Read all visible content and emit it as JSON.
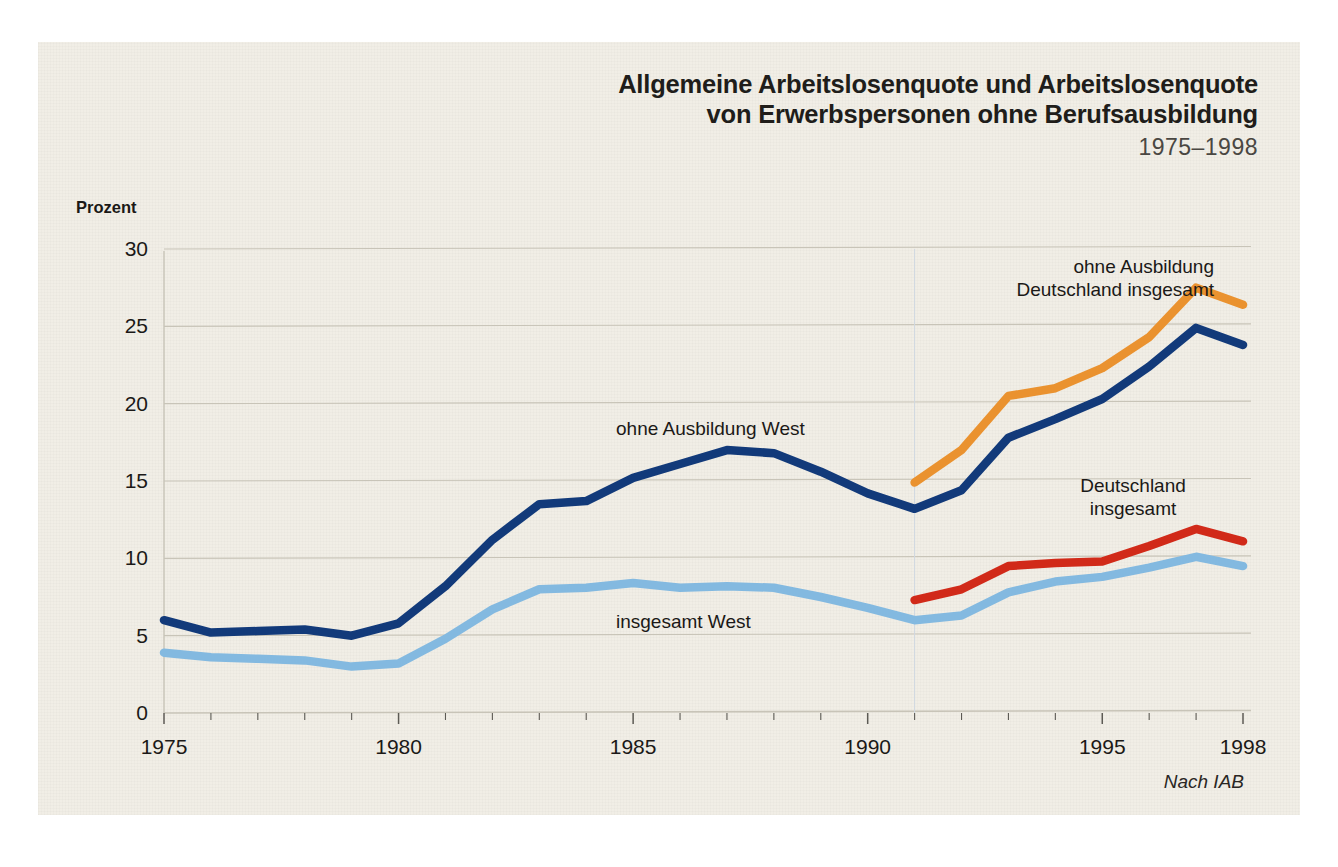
{
  "title": {
    "line1": "Allgemeine Arbeitslosenquote und Arbeitslosenquote",
    "line2": "von Erwerbspersonen ohne Berufsausbildung",
    "years": "1975–1998"
  },
  "source": "Nach IAB",
  "axis": {
    "ylabel": "Prozent"
  },
  "annotations": {
    "ohne_ausbildung_deutschland": "ohne Ausbildung\nDeutschland insgesamt",
    "ohne_ausbildung_deutschland_l1": "ohne Ausbildung",
    "ohne_ausbildung_deutschland_l2": "Deutschland insgesamt",
    "ohne_ausbildung_west": "ohne Ausbildung West",
    "deutschland_insgesamt_l1": "Deutschland",
    "deutschland_insgesamt_l2": "insgesamt",
    "insgesamt_west": "insgesamt West"
  },
  "colors": {
    "background": "#f1eee6",
    "page": "#ffffff",
    "grid": "#c8c4b8",
    "text": "#1b1917",
    "ohne_ausbildung_west": "#123a7a",
    "ohne_ausbildung_deutschland": "#ea922f",
    "deutschland_insgesamt": "#d12a19",
    "insgesamt_west": "#83b9e0"
  },
  "chart_data": {
    "type": "line",
    "title": "Allgemeine Arbeitslosenquote und Arbeitslosenquote von Erwerbspersonen ohne Berufsausbildung 1975–1998",
    "xlabel": "",
    "ylabel": "Prozent",
    "xlim": [
      1975,
      1998
    ],
    "ylim": [
      0,
      30
    ],
    "yticks": [
      0,
      5,
      10,
      15,
      20,
      25,
      30
    ],
    "xticks": [
      1975,
      1980,
      1985,
      1990,
      1995,
      1998
    ],
    "xtick_labels": [
      "1975",
      "1980",
      "1985",
      "1990",
      "1995",
      "1998"
    ],
    "minor_xticks_every": 1,
    "grid": "horizontal",
    "legend": "inline-annotations",
    "series": [
      {
        "name": "ohne Ausbildung West",
        "color": "#123a7a",
        "x": [
          1975,
          1976,
          1977,
          1978,
          1979,
          1980,
          1981,
          1982,
          1983,
          1984,
          1985,
          1986,
          1987,
          1988,
          1989,
          1990,
          1991,
          1992,
          1993,
          1994,
          1995,
          1996,
          1997,
          1998
        ],
        "values": [
          6.0,
          5.2,
          5.3,
          5.4,
          5.0,
          5.8,
          8.2,
          11.2,
          13.5,
          13.7,
          15.2,
          16.1,
          17.0,
          16.8,
          15.6,
          14.2,
          13.2,
          14.4,
          17.8,
          19.0,
          20.3,
          22.4,
          24.9,
          23.8
        ]
      },
      {
        "name": "insgesamt West",
        "color": "#83b9e0",
        "x": [
          1975,
          1976,
          1977,
          1978,
          1979,
          1980,
          1981,
          1982,
          1983,
          1984,
          1985,
          1986,
          1987,
          1988,
          1989,
          1990,
          1991,
          1992,
          1993,
          1994,
          1995,
          1996,
          1997,
          1998
        ],
        "values": [
          3.9,
          3.6,
          3.5,
          3.4,
          3.0,
          3.2,
          4.8,
          6.7,
          8.0,
          8.1,
          8.4,
          8.1,
          8.2,
          8.1,
          7.5,
          6.8,
          6.0,
          6.3,
          7.8,
          8.5,
          8.8,
          9.4,
          10.1,
          9.5
        ]
      },
      {
        "name": "ohne Ausbildung Deutschland insgesamt",
        "color": "#ea922f",
        "x": [
          1991,
          1992,
          1993,
          1994,
          1995,
          1996,
          1997,
          1998
        ],
        "values": [
          14.9,
          17.0,
          20.5,
          21.0,
          22.3,
          24.3,
          27.5,
          26.4
        ]
      },
      {
        "name": "Deutschland insgesamt",
        "color": "#d12a19",
        "x": [
          1991,
          1992,
          1993,
          1994,
          1995,
          1996,
          1997,
          1998
        ],
        "values": [
          7.3,
          8.0,
          9.5,
          9.7,
          9.8,
          10.8,
          11.9,
          11.1
        ]
      }
    ]
  }
}
